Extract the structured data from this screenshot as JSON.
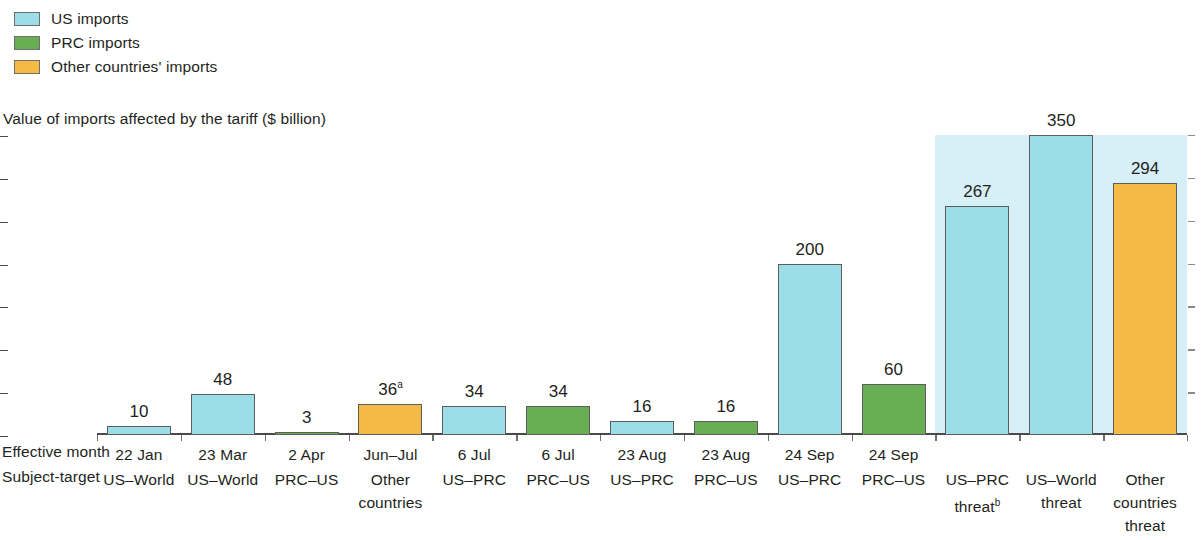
{
  "legend": {
    "items": [
      {
        "label": "US imports",
        "color": "#9bdee8",
        "key": "us"
      },
      {
        "label": "PRC imports",
        "color": "#6aae54",
        "key": "prc"
      },
      {
        "label": "Other countries' imports",
        "color": "#f5b945",
        "key": "other"
      }
    ]
  },
  "axis_title": "Value of imports affected by the tariff ($ billion)",
  "row_labels": {
    "effective_month": "Effective month",
    "subject_target": "Subject-target"
  },
  "chart_data": {
    "type": "bar",
    "title": "Value of imports affected by the tariff ($ billion)",
    "xlabel": "",
    "ylabel": "Value of imports affected by the tariff ($ billion)",
    "ylim": [
      0,
      350
    ],
    "yticks": [
      0,
      50,
      100,
      150,
      200,
      250,
      300,
      350
    ],
    "ytick_labels": [
      "0",
      "50",
      "100",
      "150",
      "200",
      "250",
      "300",
      "350"
    ],
    "grid": false,
    "legend_position": "top-left",
    "shaded_region": {
      "label": "threat",
      "color": "#d7eff6",
      "covers_bars": [
        10,
        11,
        12
      ],
      "top_value": 350
    },
    "categories": [
      "22 Jan US-World",
      "23 Mar US-World",
      "2 Apr PRC-US",
      "Jun-Jul Other countries",
      "6 Jul US-PRC",
      "6 Jul PRC-US",
      "23 Aug US-PRC",
      "23 Aug PRC-US",
      "24 Sep US-PRC",
      "24 Sep PRC-US",
      "US-PRC threat",
      "US-World threat",
      "Other countries threat"
    ],
    "values": [
      10,
      48,
      3,
      36,
      34,
      34,
      16,
      16,
      200,
      60,
      267,
      350,
      294
    ],
    "value_labels": [
      "10",
      "48",
      "3",
      "36",
      "34",
      "34",
      "16",
      "16",
      "200",
      "60",
      "267",
      "350",
      "294"
    ],
    "value_label_superscripts": [
      "",
      "",
      "",
      "a",
      "",
      "",
      "",
      "",
      "",
      "",
      "",
      "",
      ""
    ],
    "series_keys": [
      "us",
      "us",
      "prc",
      "other",
      "us",
      "prc",
      "us",
      "prc",
      "us",
      "prc",
      "us",
      "us",
      "other"
    ],
    "effective_month": [
      "22 Jan",
      "23 Mar",
      "2 Apr",
      "Jun–Jul",
      "6 Jul",
      "6 Jul",
      "23 Aug",
      "23 Aug",
      "24 Sep",
      "24 Sep",
      "",
      "",
      ""
    ],
    "subject_target": [
      "US–World",
      "US–World",
      "PRC–US",
      "Other countries",
      "US–PRC",
      "PRC–US",
      "US–PRC",
      "PRC–US",
      "US–PRC",
      "PRC–US",
      "US–PRC threat",
      "US–World threat",
      "Other countries threat"
    ],
    "subject_target_lines": [
      [
        "US–World"
      ],
      [
        "US–World"
      ],
      [
        "PRC–US"
      ],
      [
        "Other",
        "countries"
      ],
      [
        "US–PRC"
      ],
      [
        "PRC–US"
      ],
      [
        "US–PRC"
      ],
      [
        "PRC–US"
      ],
      [
        "US–PRC"
      ],
      [
        "PRC–US"
      ],
      [
        "US–PRC",
        "threat"
      ],
      [
        "US–World",
        "threat"
      ],
      [
        "Other",
        "countries",
        "threat"
      ]
    ],
    "subject_target_superscripts": [
      "",
      "",
      "",
      "",
      "",
      "",
      "",
      "",
      "",
      "",
      "b",
      "",
      ""
    ]
  }
}
